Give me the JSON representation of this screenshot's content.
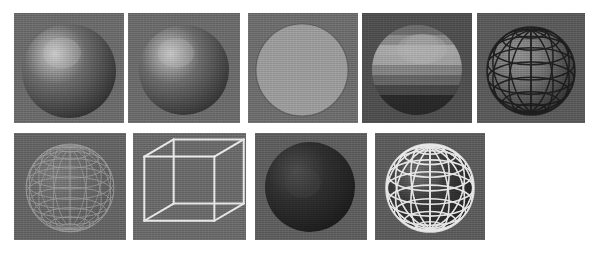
{
  "figure": {
    "caption": "",
    "page_background": "#ffffff",
    "panel_background": "#6e6e6e",
    "rows": 2,
    "columns_top": 5,
    "columns_bottom": 4
  },
  "panels": [
    {
      "id": "panel-1",
      "row": 1,
      "column": 1,
      "label": "smooth-shaded-sphere",
      "shape": "sphere",
      "render_mode": "smooth shaded",
      "x": 14,
      "y": 13,
      "width": 110,
      "height": 110,
      "background": "#6b6b6b",
      "body_color": "#6a6a6a",
      "highlight_color": "#c9c9c9",
      "highlight_cx": 48,
      "highlight_cy": 40,
      "sphere_cx": 55,
      "sphere_cy": 58,
      "sphere_r": 47,
      "wireframe": false,
      "wireframe_color": "",
      "shadow_color": "#2b2b2b"
    },
    {
      "id": "panel-2",
      "row": 1,
      "column": 2,
      "label": "smooth-shaded-sphere-variant",
      "shape": "sphere",
      "render_mode": "smooth shaded",
      "x": 128,
      "y": 13,
      "width": 112,
      "height": 110,
      "background": "#6b6b6b",
      "body_color": "#6a6a6a",
      "highlight_color": "#c4c4c4",
      "highlight_cx": 48,
      "highlight_cy": 40,
      "sphere_cx": 56,
      "sphere_cy": 57,
      "sphere_r": 45,
      "wireframe": false,
      "wireframe_color": "",
      "shadow_color": "#2e2e2e"
    },
    {
      "id": "panel-3",
      "row": 1,
      "column": 3,
      "label": "flat-shaded-disc",
      "shape": "disc",
      "render_mode": "constant flat shaded",
      "x": 248,
      "y": 13,
      "width": 110,
      "height": 110,
      "background": "#6d6d6d",
      "body_color": "#9a9a9a",
      "highlight_color": "#9a9a9a",
      "highlight_cx": 55,
      "highlight_cy": 55,
      "sphere_cx": 54,
      "sphere_cy": 57,
      "sphere_r": 46,
      "wireframe": false,
      "wireframe_color": "",
      "shadow_color": "#4a4a4a"
    },
    {
      "id": "panel-4",
      "row": 1,
      "column": 4,
      "label": "faceted-banded-sphere",
      "shape": "sphere",
      "render_mode": "facet banded shaded",
      "x": 362,
      "y": 13,
      "width": 110,
      "height": 110,
      "background": "#4f4f4f",
      "body_color": "#6a6a6a",
      "highlight_color": "#b6b6b6",
      "highlight_cx": 60,
      "highlight_cy": 36,
      "sphere_cx": 55,
      "sphere_cy": 57,
      "sphere_r": 45,
      "wireframe": false,
      "wireframe_color": "",
      "shadow_color": "#2a2a2a",
      "bands": 9
    },
    {
      "id": "panel-5",
      "row": 1,
      "column": 5,
      "label": "dark-wireframe-overlay-sphere",
      "shape": "sphere",
      "render_mode": "shaded with dark wireframe grid",
      "x": 477,
      "y": 13,
      "width": 108,
      "height": 110,
      "background": "#5a5a5a",
      "body_color": "#707070",
      "highlight_color": "#8e8e8e",
      "highlight_cx": 46,
      "highlight_cy": 42,
      "sphere_cx": 54,
      "sphere_cy": 58,
      "sphere_r": 44,
      "wireframe": true,
      "wireframe_color": "#1c1c1c",
      "shadow_color": "#2b2b2b",
      "meridians": 12,
      "parallels": 9
    },
    {
      "id": "panel-6",
      "row": 2,
      "column": 1,
      "label": "dense-light-wireframe-sphere",
      "shape": "sphere",
      "render_mode": "wireframe hidden lines shown",
      "x": 14,
      "y": 133,
      "width": 112,
      "height": 107,
      "background": "#646464",
      "body_color": "#6a6a6a",
      "highlight_color": "#7a7a7a",
      "highlight_cx": 50,
      "highlight_cy": 45,
      "sphere_cx": 56,
      "sphere_cy": 55,
      "sphere_r": 44,
      "wireframe": true,
      "wireframe_color": "#a6a6a6",
      "shadow_color": "#5a5a5a",
      "meridians": 16,
      "parallels": 13
    },
    {
      "id": "panel-7",
      "row": 2,
      "column": 2,
      "label": "wireframe-cube",
      "shape": "cube",
      "render_mode": "wireframe",
      "x": 133,
      "y": 133,
      "width": 113,
      "height": 107,
      "background": "#6a6a6a",
      "body_color": "#6a6a6a",
      "highlight_color": "#6a6a6a",
      "highlight_cx": 56,
      "highlight_cy": 53,
      "sphere_cx": 56,
      "sphere_cy": 53,
      "sphere_r": 0,
      "wireframe": true,
      "wireframe_color": "#e8e8e8",
      "shadow_color": "#6a6a6a"
    },
    {
      "id": "panel-8",
      "row": 2,
      "column": 3,
      "label": "dark-diffuse-sphere",
      "shape": "sphere",
      "render_mode": "low key diffuse shaded",
      "x": 255,
      "y": 133,
      "width": 112,
      "height": 107,
      "background": "#5e5e5e",
      "body_color": "#2f2f2f",
      "highlight_color": "#4c4c4c",
      "highlight_cx": 48,
      "highlight_cy": 50,
      "sphere_cx": 55,
      "sphere_cy": 54,
      "sphere_r": 45,
      "wireframe": false,
      "wireframe_color": "",
      "shadow_color": "#1a1a1a"
    },
    {
      "id": "panel-9",
      "row": 2,
      "column": 4,
      "label": "bright-wireframe-globe",
      "shape": "sphere",
      "render_mode": "shaded with bright wireframe grid",
      "x": 375,
      "y": 133,
      "width": 110,
      "height": 107,
      "background": "#5c5c5c",
      "body_color": "#3a3a3a",
      "highlight_color": "#6e6e6e",
      "highlight_cx": 50,
      "highlight_cy": 40,
      "sphere_cx": 55,
      "sphere_cy": 55,
      "sphere_r": 44,
      "wireframe": true,
      "wireframe_color": "#f0f0f0",
      "shadow_color": "#1f1f1f",
      "meridians": 14,
      "parallels": 10
    }
  ]
}
